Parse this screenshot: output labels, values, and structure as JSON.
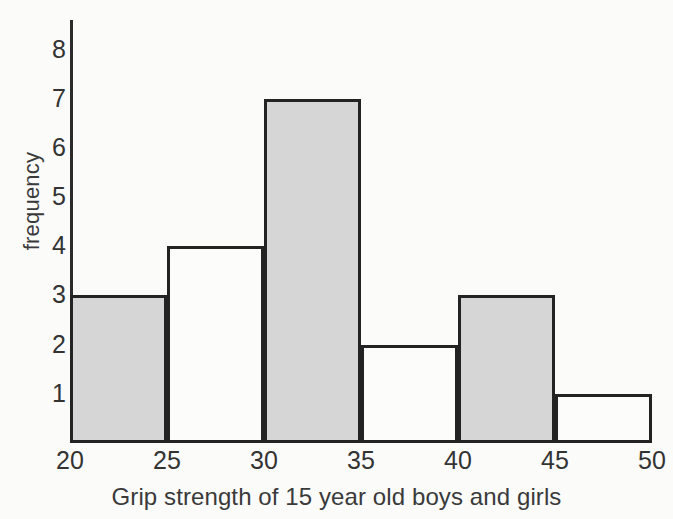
{
  "chart_data": {
    "type": "bar",
    "title": "",
    "subtitle": "",
    "xlabel": "Grip strength of 15 year old boys and girls",
    "ylabel": "frequency",
    "categories": [
      "20-25",
      "25-30",
      "30-35",
      "35-40",
      "40-45",
      "45-50"
    ],
    "bin_edges": [
      20,
      25,
      30,
      35,
      40,
      45,
      50
    ],
    "values": [
      3,
      4,
      7,
      2,
      3,
      1
    ],
    "bar_fills": [
      "gray",
      "white",
      "gray",
      "white",
      "gray",
      "white"
    ],
    "xlim": [
      20,
      50
    ],
    "ylim": [
      0,
      8.6
    ],
    "xticks": [
      20,
      25,
      30,
      35,
      40,
      45,
      50
    ],
    "yticks": [
      1,
      2,
      3,
      4,
      5,
      6,
      7,
      8
    ],
    "xtick_labels": [
      "20",
      "25",
      "30",
      "35",
      "40",
      "45",
      "50"
    ],
    "ytick_labels": [
      "1",
      "2",
      "3",
      "4",
      "5",
      "6",
      "7",
      "8"
    ],
    "grid": false,
    "legend": null,
    "annotations": [],
    "colors": {
      "bar_fill_gray": "#d6d6d6",
      "bar_fill_white": "#fcfcfb",
      "bar_outline": "#232323",
      "axis": "#2b2b2b",
      "text": "#333333",
      "background": "#fbfbfa"
    }
  }
}
